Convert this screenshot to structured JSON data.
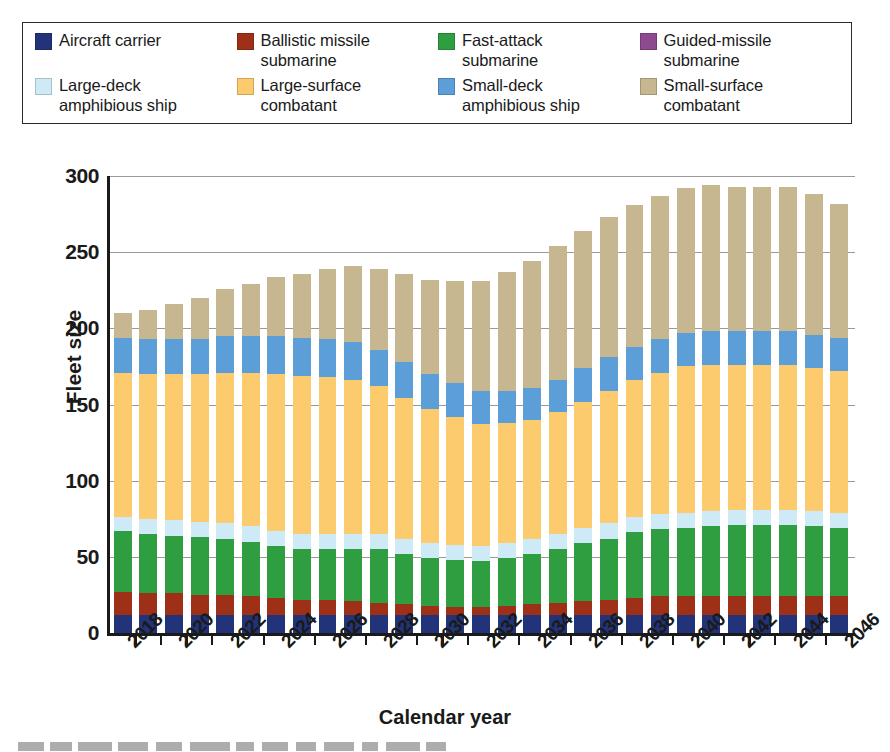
{
  "legend": {
    "items": [
      {
        "label": "Aircraft carrier",
        "color": "#22337a",
        "key": "aircraft_carrier"
      },
      {
        "label": "Ballistic missile\nsubmarine",
        "color": "#9e3018",
        "key": "ballistic_missile_submarine"
      },
      {
        "label": "Fast-attack\nsubmarine",
        "color": "#2f9e41",
        "key": "fast_attack_submarine"
      },
      {
        "label": "Guided-missile\nsubmarine",
        "color": "#8e4a8e",
        "key": "guided_missile_submarine"
      },
      {
        "label": "Large-deck\namphibious ship",
        "color": "#cfeaf7",
        "key": "large_deck_amphibious_ship"
      },
      {
        "label": "Large-surface\ncombatant",
        "color": "#fbcb6d",
        "key": "large_surface_combatant"
      },
      {
        "label": "Small-deck\namphibious ship",
        "color": "#5c9fd8",
        "key": "small_deck_amphibious_ship"
      },
      {
        "label": "Small-surface\ncombatant",
        "color": "#c6b790",
        "key": "small_surface_combatant"
      }
    ]
  },
  "chart_data": {
    "type": "bar",
    "title": "",
    "xlabel": "Calendar year",
    "ylabel": "Fleet size",
    "ylim": [
      0,
      300
    ],
    "yticks": [
      0,
      50,
      100,
      150,
      200,
      250,
      300
    ],
    "grid": true,
    "stacked": true,
    "legend_position": "top",
    "x": [
      2018,
      2019,
      2020,
      2021,
      2022,
      2023,
      2024,
      2025,
      2026,
      2027,
      2028,
      2029,
      2030,
      2031,
      2032,
      2033,
      2034,
      2035,
      2036,
      2037,
      2038,
      2039,
      2040,
      2041,
      2042,
      2043,
      2044,
      2045,
      2046
    ],
    "xtick_labels": [
      "2018",
      "2020",
      "2022",
      "2024",
      "2026",
      "2028",
      "2030",
      "2032",
      "2034",
      "2036",
      "2038",
      "2040",
      "2042",
      "2044",
      "2046"
    ],
    "series": [
      {
        "name": "Aircraft carrier",
        "color": "#22337a",
        "values": [
          12,
          12,
          12,
          12,
          12,
          12,
          12,
          12,
          12,
          12,
          12,
          12,
          12,
          12,
          12,
          12,
          12,
          12,
          12,
          12,
          12,
          12,
          12,
          12,
          12,
          12,
          12,
          12,
          12
        ]
      },
      {
        "name": "Ballistic missile submarine",
        "color": "#9e3018",
        "values": [
          15,
          14,
          14,
          13,
          13,
          12,
          11,
          10,
          10,
          9,
          8,
          7,
          6,
          5,
          5,
          6,
          7,
          8,
          9,
          10,
          11,
          12,
          12,
          12,
          12,
          12,
          12,
          12,
          12
        ]
      },
      {
        "name": "Fast-attack submarine",
        "color": "#2f9e41",
        "values": [
          40,
          39,
          38,
          38,
          37,
          36,
          34,
          33,
          33,
          34,
          35,
          33,
          31,
          31,
          30,
          31,
          33,
          35,
          38,
          40,
          43,
          44,
          45,
          46,
          47,
          47,
          47,
          46,
          45
        ]
      },
      {
        "name": "Guided-missile submarine",
        "color": "#8e4a8e",
        "values": [
          0,
          0,
          0,
          0,
          0,
          0,
          0,
          0,
          0,
          0,
          0,
          0,
          0,
          0,
          0,
          0,
          0,
          0,
          0,
          0,
          0,
          0,
          0,
          0,
          0,
          0,
          0,
          0,
          0
        ]
      },
      {
        "name": "Large-deck amphibious ship",
        "color": "#cfeaf7",
        "values": [
          9,
          10,
          10,
          10,
          10,
          10,
          10,
          10,
          10,
          10,
          10,
          10,
          10,
          10,
          10,
          10,
          10,
          10,
          10,
          10,
          10,
          10,
          10,
          10,
          10,
          10,
          10,
          10,
          10
        ]
      },
      {
        "name": "Large-surface combatant",
        "color": "#fbcb6d",
        "values": [
          95,
          95,
          96,
          97,
          99,
          101,
          103,
          104,
          103,
          101,
          97,
          92,
          88,
          84,
          80,
          79,
          78,
          80,
          83,
          87,
          90,
          93,
          96,
          96,
          95,
          95,
          95,
          94,
          93
        ]
      },
      {
        "name": "Small-deck amphibious ship",
        "color": "#5c9fd8",
        "values": [
          23,
          23,
          23,
          23,
          24,
          24,
          25,
          25,
          25,
          25,
          24,
          24,
          23,
          22,
          22,
          21,
          21,
          21,
          22,
          22,
          22,
          22,
          22,
          22,
          22,
          22,
          22,
          22,
          22
        ]
      },
      {
        "name": "Small-surface combatant",
        "color": "#c6b790",
        "values": [
          16,
          19,
          23,
          27,
          31,
          34,
          39,
          42,
          46,
          50,
          53,
          58,
          62,
          67,
          72,
          78,
          83,
          88,
          90,
          92,
          93,
          94,
          95,
          96,
          95,
          95,
          95,
          92,
          88
        ]
      }
    ],
    "totals": [
      210,
      212,
      216,
      220,
      226,
      229,
      234,
      236,
      239,
      241,
      239,
      236,
      232,
      231,
      231,
      237,
      244,
      254,
      264,
      273,
      281,
      287,
      292,
      294,
      293,
      293,
      293,
      288,
      282
    ]
  },
  "axis": {
    "y_title": "Fleet size",
    "x_title": "Calendar year"
  }
}
